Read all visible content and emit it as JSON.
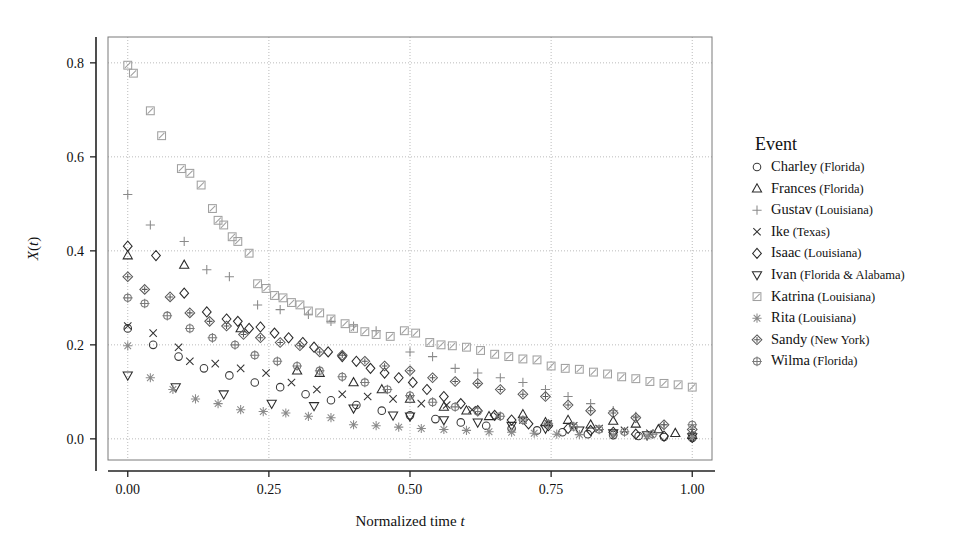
{
  "chart_data": {
    "type": "scatter",
    "title": "",
    "xlabel": "Normalized time t",
    "ylabel": "X(t)",
    "xlim": [
      -0.035,
      1.035
    ],
    "ylim": [
      -0.045,
      0.855
    ],
    "xticks": [
      0.0,
      0.25,
      0.5,
      0.75,
      1.0
    ],
    "xtick_labels": [
      "0.00",
      "0.25",
      "0.50",
      "0.75",
      "1.00"
    ],
    "yticks": [
      0.0,
      0.2,
      0.4,
      0.6,
      0.8
    ],
    "ytick_labels": [
      "0.0",
      "0.2",
      "0.4",
      "0.6",
      "0.8"
    ],
    "grid": true,
    "grid_style": "dotted",
    "legend_position": "right",
    "legend_title": "Event",
    "series": [
      {
        "name": "Charley (Florida)",
        "label_main": "Charley",
        "label_paren": "(Florida)",
        "marker": "circle",
        "color": "#3a3a3a",
        "points": [
          [
            0.0,
            0.235
          ],
          [
            0.045,
            0.2
          ],
          [
            0.09,
            0.175
          ],
          [
            0.135,
            0.15
          ],
          [
            0.18,
            0.135
          ],
          [
            0.225,
            0.12
          ],
          [
            0.27,
            0.11
          ],
          [
            0.315,
            0.095
          ],
          [
            0.36,
            0.082
          ],
          [
            0.405,
            0.072
          ],
          [
            0.45,
            0.06
          ],
          [
            0.5,
            0.05
          ],
          [
            0.545,
            0.042
          ],
          [
            0.59,
            0.035
          ],
          [
            0.635,
            0.028
          ],
          [
            0.68,
            0.022
          ],
          [
            0.725,
            0.018
          ],
          [
            0.77,
            0.014
          ],
          [
            0.815,
            0.01
          ],
          [
            0.86,
            0.008
          ],
          [
            0.905,
            0.006
          ],
          [
            0.95,
            0.004
          ],
          [
            1.0,
            0.002
          ]
        ]
      },
      {
        "name": "Frances (Florida)",
        "label_main": "Frances",
        "label_paren": "(Florida)",
        "marker": "triangle-up",
        "color": "#2b2b2b",
        "points": [
          [
            0.0,
            0.39
          ],
          [
            0.1,
            0.37
          ],
          [
            0.2,
            0.235
          ],
          [
            0.3,
            0.145
          ],
          [
            0.34,
            0.14
          ],
          [
            0.4,
            0.12
          ],
          [
            0.45,
            0.105
          ],
          [
            0.5,
            0.085
          ],
          [
            0.56,
            0.068
          ],
          [
            0.6,
            0.06
          ],
          [
            0.64,
            0.048
          ],
          [
            0.7,
            0.052
          ],
          [
            0.74,
            0.035
          ],
          [
            0.78,
            0.04
          ],
          [
            0.82,
            0.03
          ],
          [
            0.86,
            0.038
          ],
          [
            0.9,
            0.032
          ],
          [
            0.94,
            0.02
          ],
          [
            0.97,
            0.012
          ],
          [
            1.0,
            0.008
          ]
        ]
      },
      {
        "name": "Gustav (Louisiana)",
        "label_main": "Gustav",
        "label_paren": "(Louisiana)",
        "marker": "plus",
        "color": "#8a8a8a",
        "points": [
          [
            0.0,
            0.52
          ],
          [
            0.04,
            0.455
          ],
          [
            0.1,
            0.42
          ],
          [
            0.14,
            0.36
          ],
          [
            0.18,
            0.345
          ],
          [
            0.23,
            0.285
          ],
          [
            0.27,
            0.275
          ],
          [
            0.32,
            0.265
          ],
          [
            0.36,
            0.25
          ],
          [
            0.4,
            0.24
          ],
          [
            0.44,
            0.23
          ],
          [
            0.5,
            0.185
          ],
          [
            0.54,
            0.175
          ],
          [
            0.58,
            0.15
          ],
          [
            0.62,
            0.14
          ],
          [
            0.66,
            0.13
          ],
          [
            0.7,
            0.12
          ],
          [
            0.74,
            0.105
          ],
          [
            0.78,
            0.09
          ],
          [
            0.82,
            0.075
          ],
          [
            0.86,
            0.06
          ],
          [
            0.9,
            0.048
          ],
          [
            0.95,
            0.03
          ],
          [
            1.0,
            0.012
          ]
        ]
      },
      {
        "name": "Ike (Texas)",
        "label_main": "Ike",
        "label_paren": "(Texas)",
        "marker": "x",
        "color": "#333333",
        "points": [
          [
            0.0,
            0.24
          ],
          [
            0.045,
            0.225
          ],
          [
            0.09,
            0.195
          ],
          [
            0.11,
            0.165
          ],
          [
            0.155,
            0.16
          ],
          [
            0.2,
            0.15
          ],
          [
            0.245,
            0.14
          ],
          [
            0.29,
            0.12
          ],
          [
            0.335,
            0.105
          ],
          [
            0.38,
            0.095
          ],
          [
            0.425,
            0.09
          ],
          [
            0.47,
            0.085
          ],
          [
            0.52,
            0.075
          ],
          [
            0.565,
            0.072
          ],
          [
            0.61,
            0.062
          ],
          [
            0.655,
            0.048
          ],
          [
            0.7,
            0.04
          ],
          [
            0.745,
            0.032
          ],
          [
            0.79,
            0.028
          ],
          [
            0.835,
            0.022
          ],
          [
            0.88,
            0.018
          ],
          [
            0.925,
            0.012
          ],
          [
            1.0,
            0.006
          ]
        ]
      },
      {
        "name": "Isaac (Louisiana)",
        "label_main": "Isaac",
        "label_paren": "(Louisiana)",
        "marker": "diamond",
        "color": "#2b2b2b",
        "points": [
          [
            0.0,
            0.41
          ],
          [
            0.05,
            0.39
          ],
          [
            0.1,
            0.31
          ],
          [
            0.14,
            0.27
          ],
          [
            0.175,
            0.255
          ],
          [
            0.195,
            0.25
          ],
          [
            0.215,
            0.235
          ],
          [
            0.235,
            0.238
          ],
          [
            0.26,
            0.225
          ],
          [
            0.285,
            0.215
          ],
          [
            0.31,
            0.205
          ],
          [
            0.33,
            0.195
          ],
          [
            0.355,
            0.185
          ],
          [
            0.38,
            0.175
          ],
          [
            0.405,
            0.165
          ],
          [
            0.43,
            0.15
          ],
          [
            0.455,
            0.14
          ],
          [
            0.48,
            0.13
          ],
          [
            0.505,
            0.12
          ],
          [
            0.53,
            0.105
          ],
          [
            0.56,
            0.09
          ],
          [
            0.59,
            0.075
          ],
          [
            0.62,
            0.06
          ],
          [
            0.65,
            0.05
          ],
          [
            0.68,
            0.04
          ],
          [
            0.71,
            0.032
          ],
          [
            0.745,
            0.028
          ],
          [
            0.78,
            0.022
          ],
          [
            0.82,
            0.018
          ],
          [
            0.86,
            0.014
          ],
          [
            0.9,
            0.01
          ],
          [
            0.95,
            0.006
          ],
          [
            1.0,
            0.003
          ]
        ]
      },
      {
        "name": "Ivan (Florida & Alabama)",
        "label_main": "Ivan",
        "label_paren": "(Florida & Alabama)",
        "marker": "triangle-down",
        "color": "#2b2b2b",
        "points": [
          [
            0.0,
            0.135
          ],
          [
            0.085,
            0.11
          ],
          [
            0.17,
            0.095
          ],
          [
            0.255,
            0.075
          ],
          [
            0.33,
            0.07
          ],
          [
            0.4,
            0.065
          ],
          [
            0.47,
            0.05
          ],
          [
            0.5,
            0.048
          ],
          [
            0.56,
            0.04
          ],
          [
            0.62,
            0.035
          ],
          [
            0.68,
            0.028
          ],
          [
            0.74,
            0.022
          ],
          [
            0.8,
            0.018
          ],
          [
            0.86,
            0.012
          ],
          [
            0.92,
            0.008
          ],
          [
            1.0,
            0.004
          ]
        ]
      },
      {
        "name": "Katrina (Louisiana)",
        "label_main": "Katrina",
        "label_paren": "(Louisiana)",
        "marker": "square-slash",
        "color": "#a0a0a0",
        "points": [
          [
            0.0,
            0.795
          ],
          [
            0.01,
            0.778
          ],
          [
            0.04,
            0.698
          ],
          [
            0.06,
            0.645
          ],
          [
            0.095,
            0.575
          ],
          [
            0.11,
            0.565
          ],
          [
            0.13,
            0.54
          ],
          [
            0.15,
            0.49
          ],
          [
            0.16,
            0.465
          ],
          [
            0.17,
            0.455
          ],
          [
            0.185,
            0.43
          ],
          [
            0.195,
            0.42
          ],
          [
            0.215,
            0.395
          ],
          [
            0.23,
            0.33
          ],
          [
            0.245,
            0.32
          ],
          [
            0.26,
            0.305
          ],
          [
            0.275,
            0.3
          ],
          [
            0.29,
            0.29
          ],
          [
            0.305,
            0.285
          ],
          [
            0.32,
            0.272
          ],
          [
            0.34,
            0.268
          ],
          [
            0.36,
            0.255
          ],
          [
            0.385,
            0.245
          ],
          [
            0.4,
            0.235
          ],
          [
            0.42,
            0.228
          ],
          [
            0.44,
            0.222
          ],
          [
            0.465,
            0.218
          ],
          [
            0.49,
            0.23
          ],
          [
            0.51,
            0.225
          ],
          [
            0.535,
            0.205
          ],
          [
            0.555,
            0.2
          ],
          [
            0.575,
            0.198
          ],
          [
            0.6,
            0.195
          ],
          [
            0.625,
            0.188
          ],
          [
            0.65,
            0.18
          ],
          [
            0.675,
            0.175
          ],
          [
            0.7,
            0.17
          ],
          [
            0.725,
            0.168
          ],
          [
            0.75,
            0.155
          ],
          [
            0.775,
            0.15
          ],
          [
            0.8,
            0.148
          ],
          [
            0.825,
            0.142
          ],
          [
            0.85,
            0.138
          ],
          [
            0.875,
            0.132
          ],
          [
            0.9,
            0.128
          ],
          [
            0.925,
            0.122
          ],
          [
            0.95,
            0.118
          ],
          [
            0.975,
            0.115
          ],
          [
            1.0,
            0.11
          ]
        ]
      },
      {
        "name": "Rita (Louisiana)",
        "label_main": "Rita",
        "label_paren": "(Louisiana)",
        "marker": "asterisk",
        "color": "#8a8a8a",
        "points": [
          [
            0.0,
            0.198
          ],
          [
            0.04,
            0.13
          ],
          [
            0.08,
            0.105
          ],
          [
            0.12,
            0.085
          ],
          [
            0.16,
            0.075
          ],
          [
            0.2,
            0.062
          ],
          [
            0.24,
            0.058
          ],
          [
            0.28,
            0.055
          ],
          [
            0.32,
            0.048
          ],
          [
            0.36,
            0.045
          ],
          [
            0.4,
            0.03
          ],
          [
            0.44,
            0.028
          ],
          [
            0.48,
            0.025
          ],
          [
            0.52,
            0.022
          ],
          [
            0.56,
            0.02
          ],
          [
            0.6,
            0.018
          ],
          [
            0.64,
            0.015
          ],
          [
            0.68,
            0.014
          ],
          [
            0.72,
            0.012
          ],
          [
            0.76,
            0.01
          ],
          [
            0.8,
            0.009
          ],
          [
            0.86,
            0.008
          ],
          [
            0.92,
            0.006
          ],
          [
            1.0,
            0.004
          ]
        ]
      },
      {
        "name": "Sandy (New York)",
        "label_main": "Sandy",
        "label_paren": "(New York)",
        "marker": "diamond-cross",
        "color": "#5a5a5a",
        "points": [
          [
            0.0,
            0.345
          ],
          [
            0.03,
            0.318
          ],
          [
            0.075,
            0.302
          ],
          [
            0.11,
            0.268
          ],
          [
            0.145,
            0.25
          ],
          [
            0.175,
            0.24
          ],
          [
            0.205,
            0.222
          ],
          [
            0.235,
            0.215
          ],
          [
            0.27,
            0.205
          ],
          [
            0.305,
            0.198
          ],
          [
            0.34,
            0.185
          ],
          [
            0.38,
            0.178
          ],
          [
            0.42,
            0.165
          ],
          [
            0.455,
            0.155
          ],
          [
            0.5,
            0.145
          ],
          [
            0.54,
            0.13
          ],
          [
            0.58,
            0.122
          ],
          [
            0.62,
            0.118
          ],
          [
            0.66,
            0.105
          ],
          [
            0.7,
            0.095
          ],
          [
            0.74,
            0.09
          ],
          [
            0.78,
            0.072
          ],
          [
            0.82,
            0.06
          ],
          [
            0.86,
            0.055
          ],
          [
            0.9,
            0.045
          ],
          [
            0.95,
            0.03
          ],
          [
            1.0,
            0.02
          ]
        ]
      },
      {
        "name": "Wilma (Florida)",
        "label_main": "Wilma",
        "label_paren": "(Florida)",
        "marker": "circle-plus",
        "color": "#7a7a7a",
        "points": [
          [
            0.0,
            0.3
          ],
          [
            0.03,
            0.288
          ],
          [
            0.07,
            0.262
          ],
          [
            0.11,
            0.235
          ],
          [
            0.15,
            0.215
          ],
          [
            0.19,
            0.2
          ],
          [
            0.225,
            0.178
          ],
          [
            0.265,
            0.165
          ],
          [
            0.3,
            0.155
          ],
          [
            0.34,
            0.145
          ],
          [
            0.38,
            0.132
          ],
          [
            0.42,
            0.12
          ],
          [
            0.46,
            0.105
          ],
          [
            0.5,
            0.092
          ],
          [
            0.54,
            0.078
          ],
          [
            0.58,
            0.068
          ],
          [
            0.62,
            0.058
          ],
          [
            0.66,
            0.048
          ],
          [
            0.7,
            0.04
          ],
          [
            0.745,
            0.032
          ],
          [
            0.79,
            0.026
          ],
          [
            0.835,
            0.02
          ],
          [
            0.88,
            0.015
          ],
          [
            0.93,
            0.01
          ],
          [
            1.0,
            0.03
          ]
        ]
      }
    ]
  },
  "axes": {
    "plot_left": 108,
    "plot_right": 712,
    "plot_top": 37,
    "plot_bottom": 460
  },
  "legend": {
    "title": "Event",
    "x": 755,
    "y": 150
  }
}
